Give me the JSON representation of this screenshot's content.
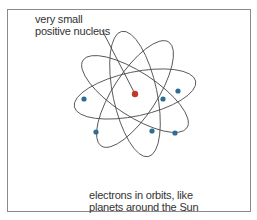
{
  "diagram": {
    "title_label": [
      "very small",
      "positive nucleus"
    ],
    "caption": [
      "electrons in orbits, like",
      "planets around the Sun"
    ],
    "nucleus_color": "#c0392b",
    "electron_color": "#2e6e96",
    "orbit_color": "#555555",
    "orbit_count": 4,
    "electron_count": 6
  }
}
